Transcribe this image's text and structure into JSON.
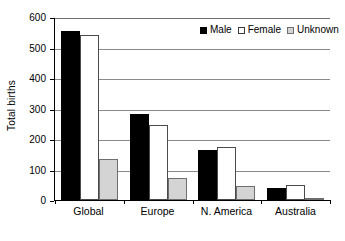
{
  "chart_data": {
    "type": "bar",
    "title": "",
    "xlabel": "",
    "ylabel": "Total births",
    "ylim": [
      0,
      600
    ],
    "yticks": [
      0,
      100,
      200,
      300,
      400,
      500,
      600
    ],
    "ytick_labels": [
      "0",
      "100",
      "200",
      "300",
      "400",
      "500",
      "600"
    ],
    "grid": true,
    "grid_axis": "y",
    "legend_position": "top-right",
    "categories": [
      "Global",
      "Europe",
      "N. America",
      "Australia"
    ],
    "series": [
      {
        "name": "Male",
        "color": "#000000",
        "swatch": "filled-black",
        "values": [
          555,
          282,
          163,
          40
        ]
      },
      {
        "name": "Female",
        "color": "#ffffff",
        "swatch": "open-white",
        "values": [
          540,
          247,
          173,
          48
        ]
      },
      {
        "name": "Unknown",
        "color": "#d4d4d4",
        "swatch": "filled-gray",
        "values": [
          135,
          72,
          45,
          5
        ]
      }
    ]
  },
  "legend": {
    "items": [
      {
        "label": "Male"
      },
      {
        "label": "Female"
      },
      {
        "label": "Unknown"
      }
    ]
  },
  "colors": {
    "male": "#000000",
    "female": "#ffffff",
    "unknown": "#d4d4d4",
    "axis": "#000000",
    "gridline": "#8a8a8a",
    "background": "#ffffff"
  }
}
